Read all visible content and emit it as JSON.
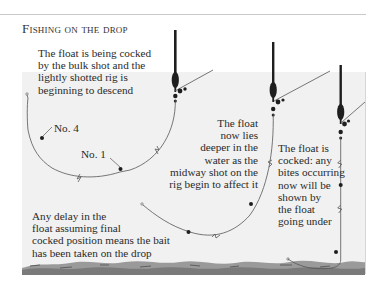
{
  "title": "Fishing on the drop",
  "annotations": {
    "stage1": [
      "The float is being cocked",
      "by the bulk shot and the",
      "lightly shotted rig is",
      "beginning to descend"
    ],
    "stage2": [
      "The float",
      "now lies",
      "deeper in the",
      "water as the",
      "midway shot on the",
      "rig begin to affect it"
    ],
    "stage3": [
      "The float is",
      "cocked: any",
      "bites occurring",
      "now will be",
      "shown by",
      "the float",
      "going under"
    ],
    "delay_note": [
      "Any delay in the",
      "float assuming final",
      "cocked position means the bait",
      "has been taken on the drop"
    ],
    "shot_labels": {
      "no4": "No. 4",
      "no1": "No. 1"
    }
  },
  "colors": {
    "water": "#f1f1f1",
    "float": "#1e1e1e",
    "line": "#555555",
    "riverbed": "#8a8a8a",
    "text": "#2a2a2a"
  }
}
